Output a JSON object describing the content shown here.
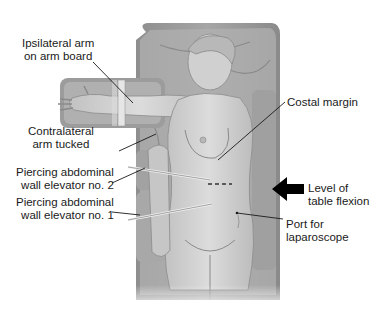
{
  "figure": {
    "colors": {
      "background": "#ffffff",
      "table": "#9a9a9a",
      "sheet": "#b8b8b8",
      "skin": "#d4d4d4",
      "skin_shadow": "#bdbdbd",
      "line": "#1a1a1a",
      "arrow": "#000000"
    },
    "labels": {
      "ipsilateral_arm": "Ipsilateral arm\non arm board",
      "contralateral_arm": "Contralateral\narm tucked",
      "elevator_2": "Piercing abdominal\nwall elevator no. 2",
      "elevator_1": "Piercing abdominal\nwall elevator no. 1",
      "costal_margin": "Costal margin",
      "table_flexion": "Level of\ntable flexion",
      "port_laparoscope": "Port for\nlaparoscope"
    }
  }
}
